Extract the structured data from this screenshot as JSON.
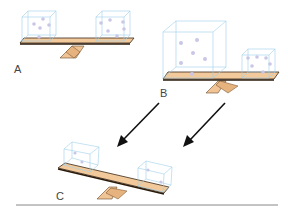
{
  "panels": [
    {
      "id": "A",
      "label": "A",
      "description": "Balanced beam with two equal-size gas boxes"
    },
    {
      "id": "B",
      "label": "B",
      "description": "Beam with a large gas box on the left and a small gas box on the right"
    },
    {
      "id": "C",
      "label": "C",
      "description": "Tilted beam with two equal-size gas boxes, left side raised"
    }
  ],
  "arrows": [
    {
      "from": "B-left",
      "to": "C"
    },
    {
      "from": "B-right",
      "to": "C"
    }
  ],
  "colors": {
    "beam_fill": "#f2c99a",
    "beam_edge": "#3a2a1a",
    "fulcrum_fill": "#f0c495",
    "box_edge": "#9fd0ea",
    "particle": "#c9c6e6",
    "arrow": "#111111",
    "ground": "#888888",
    "label": "#444444"
  }
}
